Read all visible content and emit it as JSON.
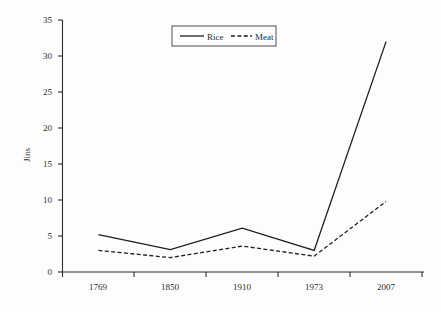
{
  "chart_data": {
    "type": "line",
    "title": "",
    "xlabel": "",
    "ylabel": "Jins",
    "categories": [
      "1769",
      "1850",
      "1910",
      "1973",
      "2007"
    ],
    "series": [
      {
        "name": "Rice",
        "style": "solid",
        "values": [
          5.2,
          3.1,
          6.1,
          3.0,
          32.0
        ]
      },
      {
        "name": "Meat",
        "style": "dashed",
        "values": [
          3.0,
          2.0,
          3.6,
          2.2,
          9.8
        ]
      }
    ],
    "ylim": [
      0,
      35
    ],
    "yticks": [
      0,
      5,
      10,
      15,
      20,
      25,
      30,
      35
    ],
    "ytick_labels": [
      "0",
      "5",
      "10",
      "15",
      "20",
      "25",
      "30",
      "35"
    ],
    "grid": false,
    "legend_position": "top-center",
    "legend_entries": [
      "Rice",
      "Meat"
    ],
    "colors": {
      "rice": "#1d1d1d",
      "meat": "#1d1d1d",
      "axis": "#2b2b2b",
      "background": "#fdfdfd"
    }
  },
  "axes": {
    "y_title": "Jins",
    "y_tick_0": "0",
    "y_tick_1": "5",
    "y_tick_2": "10",
    "y_tick_3": "15",
    "y_tick_4": "20",
    "y_tick_5": "25",
    "y_tick_6": "30",
    "y_tick_7": "35",
    "x_cat_0": "1769",
    "x_cat_1": "1850",
    "x_cat_2": "1910",
    "x_cat_3": "1973",
    "x_cat_4": "2007"
  },
  "legend": {
    "rice_label": "Rice",
    "meat_label": "Meat"
  }
}
